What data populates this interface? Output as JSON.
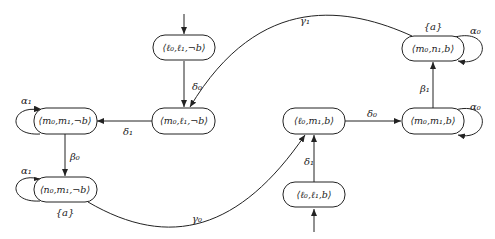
{
  "diagram": {
    "type": "state-transition-graph",
    "nodes": [
      {
        "id": "A",
        "label": "⟨ℓ₀,ℓ₁,¬b⟩",
        "cx": 184,
        "cy": 48,
        "initial": true,
        "initial_from": "top",
        "annotation": ""
      },
      {
        "id": "B",
        "label": "⟨m₀,ℓ₁,¬b⟩",
        "cx": 184,
        "cy": 121,
        "initial": false,
        "annotation": ""
      },
      {
        "id": "C",
        "label": "⟨m₀,m₁,¬b⟩",
        "cx": 65,
        "cy": 121,
        "initial": false,
        "annotation": ""
      },
      {
        "id": "D",
        "label": "⟨n₀,m₁,¬b⟩",
        "cx": 65,
        "cy": 190,
        "initial": false,
        "annotation": "{a}"
      },
      {
        "id": "E",
        "label": "⟨ℓ₀,m₁,b⟩",
        "cx": 314,
        "cy": 121,
        "initial": false,
        "annotation": ""
      },
      {
        "id": "F",
        "label": "⟨m₀,m₁,b⟩",
        "cx": 433,
        "cy": 121,
        "initial": false,
        "annotation": ""
      },
      {
        "id": "G",
        "label": "⟨m₀,n₁,b⟩",
        "cx": 433,
        "cy": 48,
        "initial": false,
        "annotation": "{a}"
      },
      {
        "id": "H",
        "label": "⟨ℓ₀,ℓ₁,b⟩",
        "cx": 314,
        "cy": 194,
        "initial": true,
        "initial_from": "bottom",
        "annotation": ""
      }
    ],
    "edges": [
      {
        "from": "A",
        "to": "B",
        "label": "δ₀"
      },
      {
        "from": "G",
        "to": "B",
        "label": "γ₁"
      },
      {
        "from": "B",
        "to": "C",
        "label": "δ₁"
      },
      {
        "from": "C",
        "to": "C",
        "label": "α₁"
      },
      {
        "from": "C",
        "to": "D",
        "label": "β₀"
      },
      {
        "from": "D",
        "to": "D",
        "label": "α₁"
      },
      {
        "from": "D",
        "to": "E",
        "label": "γ₀"
      },
      {
        "from": "H",
        "to": "E",
        "label": "δ₁"
      },
      {
        "from": "E",
        "to": "F",
        "label": "δ₀"
      },
      {
        "from": "F",
        "to": "F",
        "label": "α₀"
      },
      {
        "from": "F",
        "to": "G",
        "label": "β₁"
      },
      {
        "from": "G",
        "to": "G",
        "label": "α₀"
      }
    ]
  }
}
